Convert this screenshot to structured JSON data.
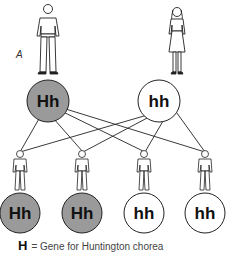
{
  "panel_label": "A",
  "parents": [
    {
      "id": "father",
      "figure": "male",
      "genotype": "Hh",
      "fill": "#9a9a9a"
    },
    {
      "id": "mother",
      "figure": "female",
      "genotype": "hh",
      "fill": "#ffffff"
    }
  ],
  "children": [
    {
      "genotype": "Hh",
      "fill": "#9a9a9a"
    },
    {
      "genotype": "Hh",
      "fill": "#9a9a9a"
    },
    {
      "genotype": "hh",
      "fill": "#ffffff"
    },
    {
      "genotype": "hh",
      "fill": "#ffffff"
    }
  ],
  "legend": {
    "symbol": "H",
    "text": "= Gene for Huntington chorea"
  },
  "colors": {
    "affected": "#9a9a9a",
    "unaffected": "#ffffff",
    "line": "#222222"
  }
}
